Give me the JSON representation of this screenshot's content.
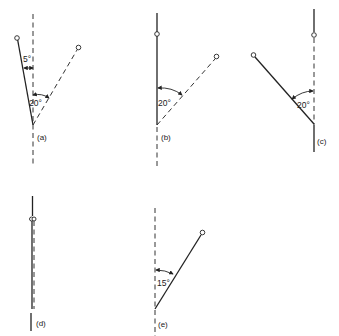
{
  "figure": {
    "panels": [
      {
        "id": "a",
        "caption": "(a)",
        "angles": [
          {
            "label": "5°",
            "value_deg": 5
          },
          {
            "label": "20°",
            "value_deg": 20
          }
        ]
      },
      {
        "id": "b",
        "caption": "(b)",
        "angles": [
          {
            "label": "20°",
            "value_deg": 20
          }
        ]
      },
      {
        "id": "c",
        "caption": "(c)",
        "angles": [
          {
            "label": "20°",
            "value_deg": 20
          }
        ]
      },
      {
        "id": "d",
        "caption": "(d)",
        "angles": []
      },
      {
        "id": "e",
        "caption": "(e)",
        "angles": [
          {
            "label": "15°",
            "value_deg": 15
          }
        ]
      }
    ]
  }
}
